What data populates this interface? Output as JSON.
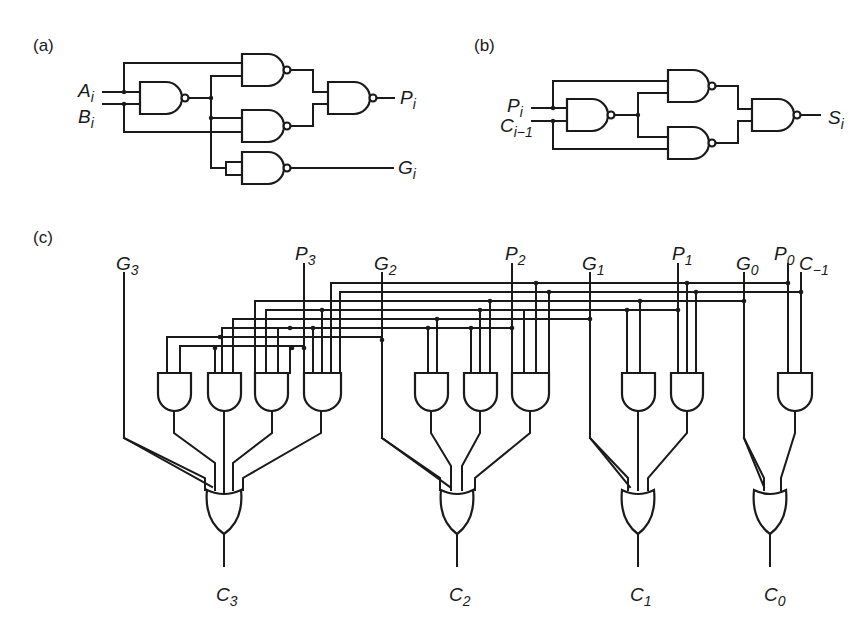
{
  "figure": {
    "panels": [
      {
        "id": "a",
        "label": "(a)",
        "description": "NAND-gate circuit generating propagate P_i and generate G_i from inputs A_i, B_i",
        "inputs": [
          {
            "name": "A",
            "sub": "i"
          },
          {
            "name": "B",
            "sub": "i"
          }
        ],
        "outputs": [
          {
            "name": "P",
            "sub": "i"
          },
          {
            "name": "G",
            "sub": "i"
          }
        ],
        "gates": {
          "nand": 5
        }
      },
      {
        "id": "b",
        "label": "(b)",
        "description": "NAND-gate XOR producing sum S_i from P_i and C_{i-1}",
        "inputs": [
          {
            "name": "P",
            "sub": "i"
          },
          {
            "name": "C",
            "sub": "i−1"
          }
        ],
        "outputs": [
          {
            "name": "S",
            "sub": "i"
          }
        ],
        "gates": {
          "nand": 4
        }
      },
      {
        "id": "c",
        "label": "(c)",
        "description": "Carry-lookahead logic: AND gates feeding OR gates to produce C_3..C_0",
        "inputs": [
          {
            "name": "G",
            "sub": "3"
          },
          {
            "name": "P",
            "sub": "3"
          },
          {
            "name": "G",
            "sub": "2"
          },
          {
            "name": "P",
            "sub": "2"
          },
          {
            "name": "G",
            "sub": "1"
          },
          {
            "name": "P",
            "sub": "1"
          },
          {
            "name": "G",
            "sub": "0"
          },
          {
            "name": "P",
            "sub": "0"
          },
          {
            "name": "C",
            "sub": "−1"
          }
        ],
        "outputs": [
          {
            "name": "C",
            "sub": "3"
          },
          {
            "name": "C",
            "sub": "2"
          },
          {
            "name": "C",
            "sub": "1"
          },
          {
            "name": "C",
            "sub": "0"
          }
        ],
        "gates": {
          "and": 10,
          "or": 4
        }
      }
    ]
  },
  "labels": {
    "a": "(a)",
    "b": "(b)",
    "c": "(c)",
    "Ai": {
      "n": "A",
      "s": "i"
    },
    "Bi": {
      "n": "B",
      "s": "i"
    },
    "Pi_out": {
      "n": "P",
      "s": "i"
    },
    "Gi_out": {
      "n": "G",
      "s": "i"
    },
    "Pi_in": {
      "n": "P",
      "s": "i"
    },
    "Cim1": {
      "n": "C",
      "s": "i−1"
    },
    "Si": {
      "n": "S",
      "s": "i"
    },
    "G3": {
      "n": "G",
      "s": "3"
    },
    "P3": {
      "n": "P",
      "s": "3"
    },
    "G2": {
      "n": "G",
      "s": "2"
    },
    "P2": {
      "n": "P",
      "s": "2"
    },
    "G1": {
      "n": "G",
      "s": "1"
    },
    "P1": {
      "n": "P",
      "s": "1"
    },
    "G0": {
      "n": "G",
      "s": "0"
    },
    "P0": {
      "n": "P",
      "s": "0"
    },
    "Cm1": {
      "n": "C",
      "s": "−1"
    },
    "C3": {
      "n": "C",
      "s": "3"
    },
    "C2": {
      "n": "C",
      "s": "2"
    },
    "C1": {
      "n": "C",
      "s": "1"
    },
    "C0": {
      "n": "C",
      "s": "0"
    }
  },
  "colors": {
    "ink": "#1a1a1a",
    "background": "#ffffff"
  }
}
